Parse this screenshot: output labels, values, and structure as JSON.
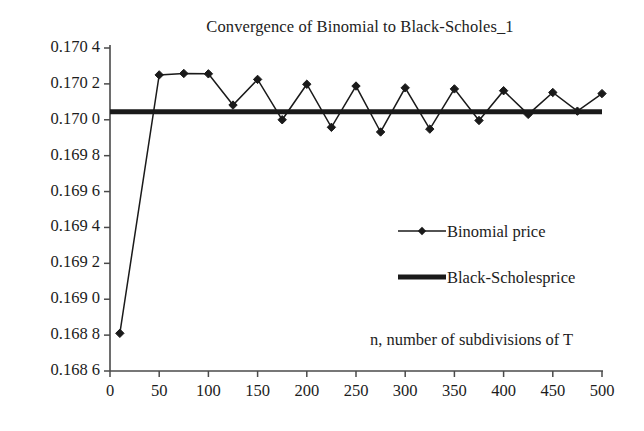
{
  "chart_data": {
    "type": "line",
    "title": "Convergence of Binomial to Black-Scholes_1",
    "xlabel": "n, number of subdivisions of T",
    "ylabel": "",
    "xlim": [
      0,
      500
    ],
    "ylim": [
      0.1686,
      0.1704
    ],
    "grid": false,
    "legend_position": "center-right",
    "xticks": [
      0,
      50,
      100,
      150,
      200,
      250,
      300,
      350,
      400,
      450,
      500
    ],
    "xtick_labels": [
      "0",
      "50",
      "100",
      "150",
      "200",
      "250",
      "300",
      "350",
      "400",
      "450",
      "500"
    ],
    "yticks": [
      0.1686,
      0.1688,
      0.169,
      0.1692,
      0.1694,
      0.1696,
      0.1698,
      0.17,
      0.1702,
      0.1704
    ],
    "ytick_labels": [
      "0.168 6",
      "0.168 8",
      "0.169 0",
      "0.169 2",
      "0.169 4",
      "0.169 6",
      "0.169 8",
      "0.170 0",
      "0.170 2",
      "0.170 4"
    ],
    "series": [
      {
        "name": "Binomial price",
        "style": "line-marker",
        "marker": "diamond",
        "color": "#1a1a1a",
        "x": [
          10,
          50,
          75,
          100,
          125,
          150,
          175,
          200,
          225,
          250,
          275,
          300,
          325,
          350,
          375,
          400,
          425,
          450,
          475,
          500
        ],
        "values": [
          0.16881,
          0.17025,
          0.170258,
          0.170256,
          0.170082,
          0.170225,
          0.17,
          0.170198,
          0.169958,
          0.170188,
          0.169932,
          0.170178,
          0.169948,
          0.170172,
          0.169996,
          0.170162,
          0.17003,
          0.170152,
          0.170048,
          0.170146
        ]
      },
      {
        "name": "Black-Scholesprice",
        "style": "thick-line",
        "color": "#1a1a1a",
        "constant_value": 0.170045,
        "x": [
          0,
          500
        ],
        "values": [
          0.170045,
          0.170045
        ]
      }
    ]
  },
  "legend": {
    "items": [
      {
        "label": "Binomial price",
        "marker": "diamond-line"
      },
      {
        "label": "Black-Scholesprice",
        "marker": "thick-line"
      }
    ]
  },
  "axes": {
    "x_axis_title": "n, number of subdivisions of T",
    "y_axis_title": ""
  }
}
